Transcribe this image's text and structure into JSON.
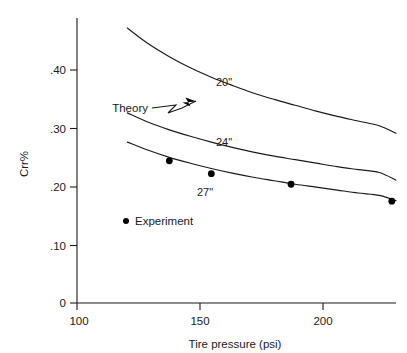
{
  "chart_data": {
    "type": "line",
    "title": "",
    "xlabel": "Tire pressure (psi)",
    "ylabel": "Crr%",
    "xlim": [
      76,
      228
    ],
    "ylim": [
      0,
      0.5
    ],
    "xticks": [
      100,
      150,
      200
    ],
    "xtick_labels": [
      "100",
      "150",
      "200"
    ],
    "yticks": [
      0,
      0.1,
      0.2,
      0.3,
      0.4
    ],
    "ytick_labels": [
      "0",
      ".10",
      ".20",
      ".30",
      ".40"
    ],
    "grid": false,
    "legend_position": "inside-lower-left",
    "series": [
      {
        "name": "20\"",
        "kind": "theory-curve",
        "label": "20\"",
        "label_at": [
          158,
          0.368
        ],
        "x": [
          100,
          110,
          120,
          130,
          140,
          150,
          160,
          170,
          180,
          190,
          200,
          210,
          220,
          228
        ],
        "values": [
          0.47,
          0.443,
          0.421,
          0.402,
          0.386,
          0.372,
          0.359,
          0.348,
          0.338,
          0.328,
          0.319,
          0.311,
          0.303,
          0.29
        ]
      },
      {
        "name": "24\"",
        "kind": "theory-curve",
        "label": "24\"",
        "label_at": [
          158,
          0.258
        ],
        "x": [
          100,
          110,
          120,
          130,
          140,
          150,
          160,
          170,
          180,
          190,
          200,
          210,
          220,
          228
        ],
        "values": [
          0.325,
          0.309,
          0.296,
          0.285,
          0.275,
          0.266,
          0.258,
          0.251,
          0.245,
          0.239,
          0.233,
          0.228,
          0.223,
          0.21
        ]
      },
      {
        "name": "27\"",
        "kind": "theory-curve",
        "label": "27\"",
        "label_at": [
          142,
          0.196
        ],
        "x": [
          100,
          110,
          120,
          130,
          140,
          150,
          160,
          170,
          180,
          190,
          200,
          210,
          220,
          228
        ],
        "values": [
          0.275,
          0.261,
          0.249,
          0.239,
          0.23,
          0.222,
          0.215,
          0.209,
          0.203,
          0.198,
          0.193,
          0.188,
          0.184,
          0.175
        ]
      },
      {
        "name": "Experiment",
        "kind": "scatter",
        "x": [
          120,
          140,
          178,
          226
        ],
        "values": [
          0.243,
          0.221,
          0.203,
          0.174
        ]
      }
    ],
    "annotations": [
      {
        "name": "theory-annotation",
        "text": "Theory",
        "text_at": [
          129,
          0.316
        ],
        "points_to": [
          162,
          0.355
        ]
      },
      {
        "name": "experiment-legend",
        "text": "Experiment",
        "marker": "dot",
        "marker_at": [
          116,
          0.132
        ],
        "text_at": [
          121,
          0.132
        ]
      }
    ]
  },
  "axes": {
    "y_label": "Crr%",
    "x_label": "Tire pressure (psi)"
  },
  "labels": {
    "series_20": "20\"",
    "series_24": "24\"",
    "series_27": "27\"",
    "theory": "Theory",
    "experiment": "Experiment",
    "ytick_0": "0",
    "ytick_10": ".10",
    "ytick_20": ".20",
    "ytick_30": ".30",
    "ytick_40": ".40",
    "xtick_100": "100",
    "xtick_150": "150",
    "xtick_200": "200"
  }
}
